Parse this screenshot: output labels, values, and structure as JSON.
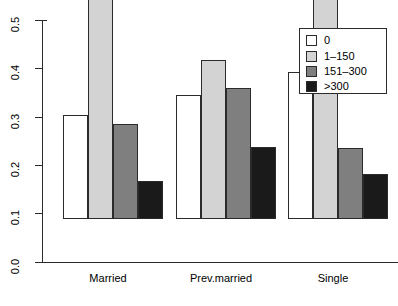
{
  "chart_data": {
    "type": "bar",
    "title": "",
    "xlabel": "",
    "ylabel": "",
    "categories": [
      "Married",
      "Prev.married",
      "Single"
    ],
    "series": [
      {
        "name": "0",
        "color": "#FFFFFF",
        "values": [
          0.215,
          0.256,
          0.303
        ]
      },
      {
        "name": "1–150",
        "color": "#D3D3D3",
        "values": [
          0.505,
          0.328,
          0.515
        ]
      },
      {
        "name": "151–300",
        "color": "#7F7F7F",
        "values": [
          0.197,
          0.27,
          0.147
        ]
      },
      {
        "name": ">300",
        "color": "#1A1A1A",
        "values": [
          0.078,
          0.148,
          0.092
        ]
      }
    ],
    "ylim": [
      0.0,
      0.5
    ],
    "ytick_labels": [
      "0.0",
      "0.1",
      "0.2",
      "0.3",
      "0.4",
      "0.5"
    ],
    "ytick_values": [
      0.0,
      0.1,
      0.2,
      0.3,
      0.4,
      0.5
    ],
    "grid": false,
    "legend_position": "top-right",
    "legend_entries": [
      "0",
      "1–150",
      "151–300",
      ">300"
    ]
  },
  "axis": {
    "y_tick_0": "0.0",
    "y_tick_1": "0.1",
    "y_tick_2": "0.2",
    "y_tick_3": "0.3",
    "y_tick_4": "0.4",
    "y_tick_5": "0.5"
  },
  "groups": {
    "g0": "Married",
    "g1": "Prev.married",
    "g2": "Single"
  },
  "legend": {
    "e0": "0",
    "e1": "1–150",
    "e2": "151–300",
    "e3": ">300"
  },
  "colors": {
    "series_0": "#FFFFFF",
    "series_1": "#D3D3D3",
    "series_2": "#7F7F7F",
    "series_3": "#1A1A1A",
    "axis": "#2B2B2B",
    "background": "#FFFFFF"
  }
}
